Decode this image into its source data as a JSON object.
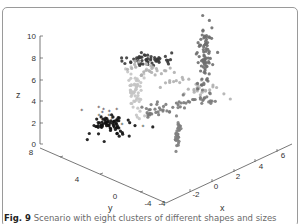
{
  "caption": {
    "fig_label": "Fig. 9",
    "text": "Scenario with eight clusters of different shapes and sizes"
  },
  "chart_data": {
    "type": "scatter3d",
    "title": "",
    "xlabel": "x",
    "ylabel": "y",
    "zlabel": "z",
    "xlim": [
      -4,
      6
    ],
    "ylim": [
      -4,
      8
    ],
    "zlim": [
      0,
      10
    ],
    "x_ticks": [
      "-4",
      "-2",
      "0",
      "2",
      "4",
      "6"
    ],
    "y_ticks": [
      "8",
      "4",
      "0",
      "-4"
    ],
    "z_ticks": [
      "10",
      "8",
      "6",
      "4",
      "2",
      "0"
    ],
    "grid": false,
    "legend": null,
    "series": [
      {
        "name": "cluster-1",
        "color": "#111111",
        "marker": "circle",
        "description": "dense black blob",
        "center_px": [
          110,
          125
        ],
        "spread": [
          22,
          10
        ],
        "count": 70
      },
      {
        "name": "cluster-2",
        "color": "#222222",
        "marker": "star",
        "description": "sparse black outliers",
        "center_px": [
          100,
          115
        ],
        "spread": [
          35,
          18
        ],
        "count": 14
      },
      {
        "name": "cluster-3",
        "color": "#c4c4c4",
        "marker": "circle",
        "description": "light grey vertical cluster",
        "center_px": [
          135,
          90
        ],
        "spread": [
          10,
          28
        ],
        "count": 60
      },
      {
        "name": "cluster-4",
        "color": "#3a3a3a",
        "marker": "circle",
        "description": "dark grey band upper-left",
        "center_px": [
          150,
          60
        ],
        "spread": [
          25,
          6
        ],
        "count": 55
      },
      {
        "name": "cluster-5",
        "color": "#b0b0b0",
        "marker": "circle",
        "description": "light grey diagonal curve",
        "center_px": [
          170,
          75
        ],
        "spread": [
          40,
          10
        ],
        "count": 60
      },
      {
        "name": "cluster-6",
        "color": "#6e6e6e",
        "marker": "circle",
        "description": "medium grey vertical column right",
        "center_px": [
          205,
          55
        ],
        "spread": [
          8,
          30
        ],
        "count": 80
      },
      {
        "name": "cluster-7",
        "color": "#7a7a7a",
        "marker": "circle",
        "description": "medium grey scattered arc",
        "center_px": [
          210,
          100
        ],
        "spread": [
          25,
          18
        ],
        "count": 60
      },
      {
        "name": "cluster-8",
        "color": "#7f7f7f",
        "marker": "circle",
        "description": "thin grey vertical needle",
        "center_px": [
          178,
          133
        ],
        "spread": [
          3,
          16
        ],
        "count": 40
      }
    ]
  },
  "axes": {
    "z": {
      "label": "z",
      "ticks": [
        {
          "v": "10",
          "y": 36
        },
        {
          "v": "8",
          "y": 58
        },
        {
          "v": "6",
          "y": 80
        },
        {
          "v": "4",
          "y": 101
        },
        {
          "v": "2",
          "y": 123
        },
        {
          "v": "0",
          "y": 144
        }
      ]
    },
    "y": {
      "label": "y",
      "ticks": [
        {
          "v": "8",
          "x": 31,
          "y": 155
        },
        {
          "v": "4",
          "x": 77,
          "y": 182
        },
        {
          "v": "0",
          "x": 115,
          "y": 199
        },
        {
          "v": "-4",
          "x": 148,
          "y": 206
        }
      ]
    },
    "x": {
      "label": "x",
      "ticks": [
        {
          "v": "-4",
          "x": 162,
          "y": 206
        },
        {
          "v": "-2",
          "x": 196,
          "y": 197
        },
        {
          "v": "0",
          "x": 216,
          "y": 189
        },
        {
          "v": "2",
          "x": 238,
          "y": 179
        },
        {
          "v": "4",
          "x": 261,
          "y": 169
        },
        {
          "v": "6",
          "x": 283,
          "y": 158
        }
      ]
    }
  }
}
